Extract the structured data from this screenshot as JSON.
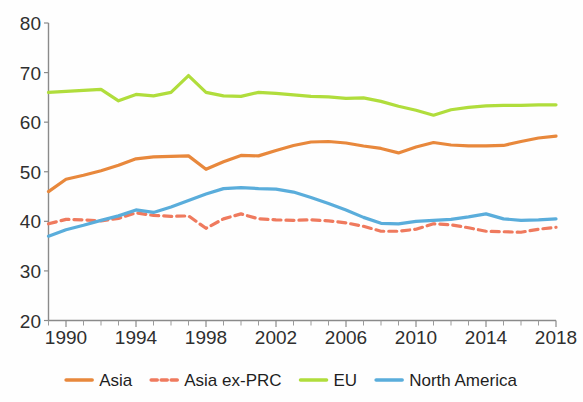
{
  "chart_data": {
    "type": "line",
    "title": "",
    "subtitle": "",
    "xlabel": "",
    "ylabel": "",
    "xlim": [
      1989,
      2018
    ],
    "ylim": [
      20,
      80
    ],
    "ytick_labels": [
      "80",
      "70",
      "60",
      "50",
      "40",
      "30",
      "20"
    ],
    "ytick_values": [
      80,
      70,
      60,
      50,
      40,
      30,
      20
    ],
    "xtick_labels": [
      "1990",
      "1994",
      "1998",
      "2002",
      "2006",
      "2010",
      "2014",
      "2018"
    ],
    "xtick_values": [
      1990,
      1994,
      1998,
      2002,
      2006,
      2010,
      2014,
      2018
    ],
    "x_minor_step": 1,
    "grid": false,
    "legend_position": "bottom",
    "x": [
      1989,
      1990,
      1991,
      1992,
      1993,
      1994,
      1995,
      1996,
      1997,
      1998,
      1999,
      2000,
      2001,
      2002,
      2003,
      2004,
      2005,
      2006,
      2007,
      2008,
      2009,
      2010,
      2011,
      2012,
      2013,
      2014,
      2015,
      2016,
      2017,
      2018
    ],
    "series": [
      {
        "name": "Asia",
        "color": "#e8883c",
        "style": "solid",
        "values": [
          46.0,
          48.5,
          49.3,
          50.2,
          51.3,
          52.6,
          53.0,
          53.1,
          53.2,
          50.5,
          52.0,
          53.3,
          53.2,
          54.3,
          55.3,
          56.0,
          56.1,
          55.8,
          55.2,
          54.7,
          53.8,
          55.0,
          55.9,
          55.4,
          55.2,
          55.2,
          55.3,
          56.1,
          56.8,
          57.2
        ]
      },
      {
        "name": "Asia ex-PRC",
        "color": "#ef7a5e",
        "style": "dashed",
        "values": [
          39.5,
          40.4,
          40.3,
          40.1,
          40.6,
          41.7,
          41.2,
          41.0,
          41.1,
          38.6,
          40.5,
          41.5,
          40.5,
          40.3,
          40.2,
          40.3,
          40.1,
          39.7,
          39.0,
          38.0,
          38.0,
          38.4,
          39.5,
          39.3,
          38.7,
          38.0,
          37.9,
          37.8,
          38.4,
          38.8
        ]
      },
      {
        "name": "EU",
        "color": "#b0dd3c",
        "style": "solid",
        "values": [
          66.0,
          66.2,
          66.4,
          66.6,
          64.3,
          65.6,
          65.3,
          66.0,
          69.4,
          66.0,
          65.3,
          65.2,
          66.0,
          65.8,
          65.5,
          65.2,
          65.1,
          64.8,
          64.9,
          64.2,
          63.2,
          62.4,
          61.4,
          62.5,
          63.0,
          63.3,
          63.4,
          63.4,
          63.5,
          63.5
        ]
      },
      {
        "name": "North America",
        "color": "#5aaddb",
        "style": "solid",
        "values": [
          37.0,
          38.3,
          39.2,
          40.2,
          41.1,
          42.3,
          41.8,
          42.9,
          44.2,
          45.5,
          46.6,
          46.8,
          46.6,
          46.5,
          45.9,
          44.8,
          43.6,
          42.3,
          40.8,
          39.6,
          39.5,
          40.0,
          40.2,
          40.4,
          40.9,
          41.5,
          40.5,
          40.2,
          40.3,
          40.5
        ]
      }
    ]
  },
  "legend": {
    "items": [
      {
        "label": "Asia"
      },
      {
        "label": "Asia ex-PRC"
      },
      {
        "label": "EU"
      },
      {
        "label": "North America"
      }
    ]
  }
}
